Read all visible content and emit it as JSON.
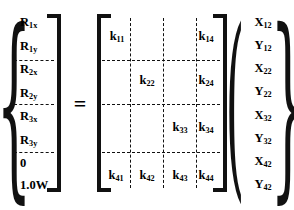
{
  "equation": {
    "operator": "=",
    "load_vector": {
      "left_delimiter": "{",
      "right_delimiter": "]",
      "entries": [
        {
          "base": "R",
          "sub": "1x",
          "text": "R1x"
        },
        {
          "base": "R",
          "sub": "1y",
          "text": "R1y"
        },
        {
          "base": "R",
          "sub": "2x",
          "text": "R2x"
        },
        {
          "base": "R",
          "sub": "2y",
          "text": "R2y"
        },
        {
          "base": "R",
          "sub": "3x",
          "text": "R3x"
        },
        {
          "base": "R",
          "sub": "3y",
          "text": "R3y"
        },
        {
          "base": "0",
          "sub": "",
          "text": "0"
        },
        {
          "base": "1.0W",
          "sub": "",
          "text": "1.0W"
        }
      ],
      "partition_after_rows": [
        2,
        4,
        6
      ]
    },
    "stiffness_matrix": {
      "left_delimiter": "[",
      "right_delimiter": "]",
      "rows": 4,
      "cols": 4,
      "cells": [
        {
          "row": 1,
          "col": 1,
          "base": "k",
          "sub": "11",
          "text": "k11"
        },
        {
          "row": 1,
          "col": 4,
          "base": "k",
          "sub": "14",
          "text": "k14"
        },
        {
          "row": 2,
          "col": 2,
          "base": "k",
          "sub": "22",
          "text": "k22"
        },
        {
          "row": 2,
          "col": 4,
          "base": "k",
          "sub": "24",
          "text": "k24"
        },
        {
          "row": 3,
          "col": 3,
          "base": "k",
          "sub": "33",
          "text": "k33"
        },
        {
          "row": 3,
          "col": 4,
          "base": "k",
          "sub": "34",
          "text": "k34"
        },
        {
          "row": 4,
          "col": 1,
          "base": "k",
          "sub": "41",
          "text": "k41"
        },
        {
          "row": 4,
          "col": 2,
          "base": "k",
          "sub": "42",
          "text": "k42"
        },
        {
          "row": 4,
          "col": 3,
          "base": "k",
          "sub": "43",
          "text": "k43"
        },
        {
          "row": 4,
          "col": 4,
          "base": "k",
          "sub": "44",
          "text": "k44"
        }
      ]
    },
    "displacement_vector": {
      "left_delimiter": "(",
      "right_delimiter": "}",
      "entries": [
        {
          "base": "X",
          "sub": "12",
          "text": "X12"
        },
        {
          "base": "Y",
          "sub": "12",
          "text": "Y12"
        },
        {
          "base": "X",
          "sub": "22",
          "text": "X22"
        },
        {
          "base": "Y",
          "sub": "22",
          "text": "Y22"
        },
        {
          "base": "X",
          "sub": "32",
          "text": "X32"
        },
        {
          "base": "Y",
          "sub": "32",
          "text": "Y32"
        },
        {
          "base": "X",
          "sub": "42",
          "text": "X42"
        },
        {
          "base": "Y",
          "sub": "42",
          "text": "Y42"
        }
      ],
      "partition_after_rows": [
        2,
        4,
        6
      ]
    },
    "colors": {
      "ink": "#111111",
      "background": "#ffffff"
    }
  }
}
